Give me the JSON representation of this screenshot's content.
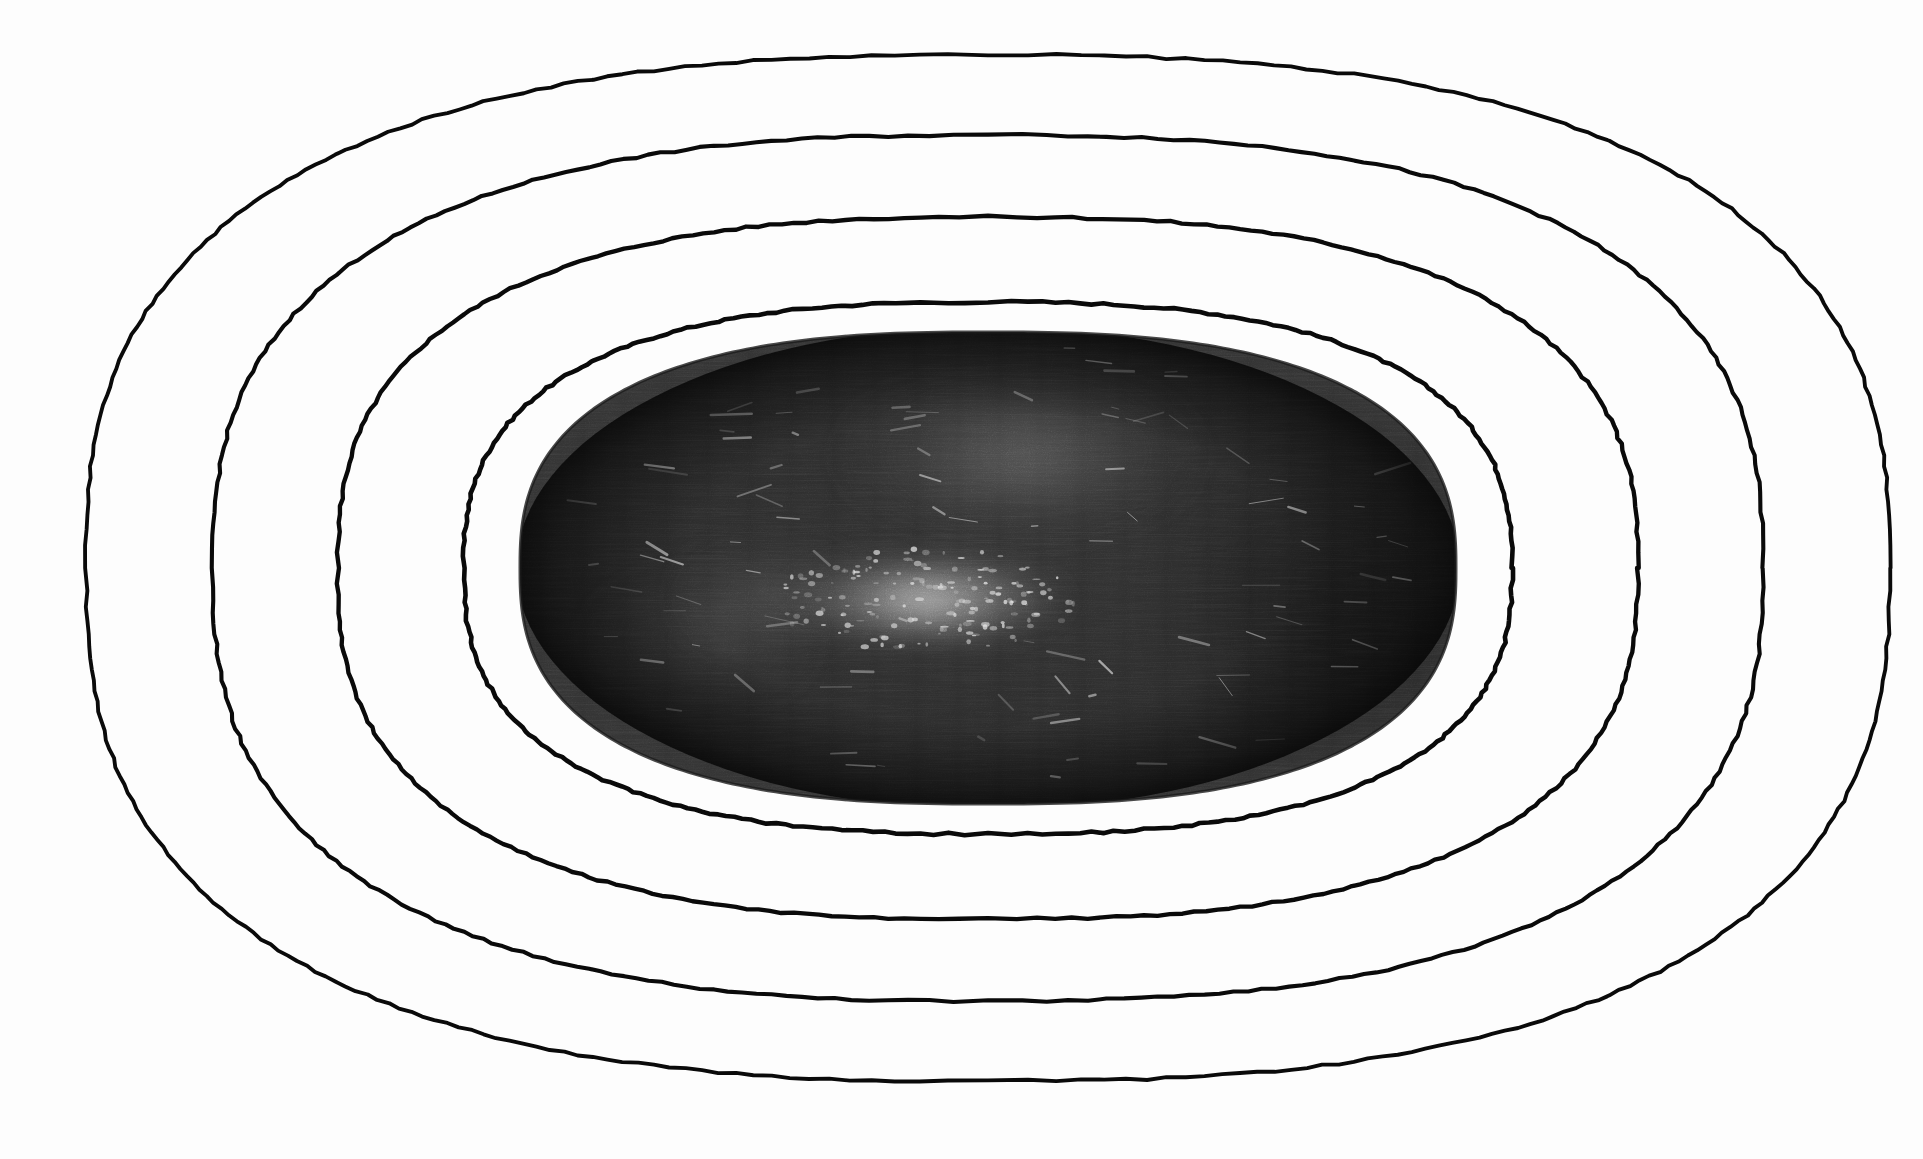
{
  "figure": {
    "kind": "astronomical-photographic-plate-with-isophotes",
    "background_color": "#fdfdfd",
    "contour_line_color": "#0a0a0a",
    "plate_dark_color": "#343434",
    "plate_edge_color": "#141414",
    "plate_core_color": "#c9c9c9",
    "canvas": {
      "width": 1923,
      "height": 1159
    }
  },
  "chart_data": {
    "type": "contour",
    "title": "",
    "subtitle": "",
    "xlabel": "",
    "ylabel": "",
    "grid": false,
    "legend_position": "none",
    "center": {
      "x": 988,
      "y": 568
    },
    "orientation_deg": 0,
    "axis_ranges": {
      "xlim": [
        0,
        1923
      ],
      "ylim": [
        0,
        1159
      ]
    },
    "superellipse_exponent": 2.6,
    "levels": [
      {
        "name": "plate-boundary",
        "label": "photographic plate edge",
        "index": 0,
        "semi_major_x": 468,
        "semi_minor_y": 236,
        "left_x": 520,
        "right_x": 1456,
        "top_y": 332,
        "bottom_y": 804,
        "drawn": false
      },
      {
        "name": "isophote-1",
        "label": "innermost isophote",
        "index": 1,
        "semi_major_x": 524,
        "semi_minor_y": 266,
        "left_x": 464,
        "right_x": 1512,
        "top_y": 302,
        "bottom_y": 834,
        "drawn": true
      },
      {
        "name": "isophote-2",
        "label": "second isophote",
        "index": 2,
        "semi_major_x": 650,
        "semi_minor_y": 351,
        "left_x": 338,
        "right_x": 1638,
        "top_y": 217,
        "bottom_y": 919,
        "drawn": true
      },
      {
        "name": "isophote-3",
        "label": "third isophote",
        "index": 3,
        "semi_major_x": 775,
        "semi_minor_y": 433,
        "left_x": 213,
        "right_x": 1763,
        "top_y": 135,
        "bottom_y": 1001,
        "drawn": true
      },
      {
        "name": "isophote-4",
        "label": "outermost isophote",
        "index": 4,
        "semi_major_x": 902,
        "semi_minor_y": 513,
        "left_x": 86,
        "right_x": 1890,
        "top_y": 55,
        "bottom_y": 1081,
        "drawn": true
      }
    ],
    "contour_count": 4,
    "features": [
      {
        "name": "northern-diffuse-glow",
        "x": 1020,
        "y": 455,
        "rx": 185,
        "ry": 72,
        "brightness": 0.52
      },
      {
        "name": "central-bar-bright-knot",
        "x": 925,
        "y": 600,
        "rx": 150,
        "ry": 52,
        "brightness": 0.95
      },
      {
        "name": "bar-western-extension",
        "x": 770,
        "y": 598,
        "rx": 95,
        "ry": 42,
        "brightness": 0.4
      },
      {
        "name": "southwest-faint-arm",
        "x": 700,
        "y": 640,
        "rx": 120,
        "ry": 60,
        "brightness": 0.22
      },
      {
        "name": "eastern-dark-lobe",
        "x": 1330,
        "y": 600,
        "rx": 170,
        "ry": 185,
        "brightness": -0.35
      },
      {
        "name": "small-dark-ring-artifact",
        "x": 1356,
        "y": 402,
        "rx": 7,
        "ry": 6,
        "brightness": -0.2
      }
    ]
  },
  "accessibility": {
    "alt": "A scanned photographic plate showing an elongated elliptical galaxy image with a bright knotted bar across its centre, surrounded by four hand-drawn concentric isophote contour curves."
  }
}
